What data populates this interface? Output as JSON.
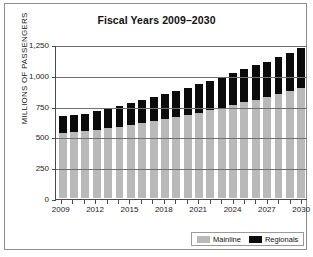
{
  "chart_data": {
    "type": "bar",
    "title": "Fiscal Years 2009–2030",
    "xlabel": "",
    "ylabel": "MILLIONS OF PASSENGERS",
    "ylim": [
      0,
      1250
    ],
    "yticks": [
      0,
      250,
      500,
      750,
      1000,
      1250
    ],
    "ytick_labels": [
      "0",
      "250",
      "500",
      "750",
      "1,000",
      "1,250"
    ],
    "grid": true,
    "stacked": true,
    "legend_position": "bottom-right",
    "categories": [
      "2009",
      "2010",
      "2011",
      "2012",
      "2013",
      "2014",
      "2015",
      "2016",
      "2017",
      "2018",
      "2019",
      "2020",
      "2021",
      "2022",
      "2023",
      "2024",
      "2025",
      "2026",
      "2027",
      "2028",
      "2029",
      "2030"
    ],
    "xtick_labels": [
      "2009",
      "2012",
      "2015",
      "2018",
      "2021",
      "2024",
      "2027",
      "2030"
    ],
    "series": [
      {
        "name": "Mainline",
        "color": "#b9b9b9",
        "values": [
          530,
          533,
          540,
          552,
          565,
          578,
          592,
          607,
          623,
          640,
          657,
          675,
          694,
          713,
          733,
          754,
          776,
          798,
          820,
          843,
          866,
          890
        ]
      },
      {
        "name": "Regionals",
        "color": "#0b0b0b",
        "values": [
          132,
          137,
          142,
          155,
          163,
          171,
          178,
          185,
          193,
          201,
          210,
          219,
          228,
          238,
          248,
          258,
          268,
          278,
          288,
          298,
          310,
          330
        ]
      }
    ],
    "totals": [
      662,
      670,
      682,
      707,
      728,
      749,
      770,
      792,
      816,
      841,
      867,
      894,
      922,
      951,
      981,
      1012,
      1044,
      1076,
      1108,
      1141,
      1176,
      1220
    ]
  },
  "legend": {
    "entries": [
      {
        "label": "Mainline",
        "color": "#b9b9b9"
      },
      {
        "label": "Regionals",
        "color": "#0b0b0b"
      }
    ]
  }
}
